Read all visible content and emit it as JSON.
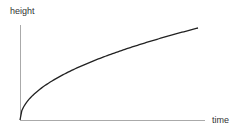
{
  "chart_data": {
    "type": "line",
    "title": "",
    "xlabel": "time",
    "ylabel": "height",
    "series": [
      {
        "name": "height vs time",
        "shape": "square-root growth",
        "x": [
          0,
          0.1,
          0.25,
          0.5,
          0.75,
          1.0
        ],
        "y": [
          0,
          0.32,
          0.5,
          0.71,
          0.87,
          1.0
        ]
      }
    ],
    "grid": false,
    "ticks": false
  },
  "labels": {
    "x": "time",
    "y": "height"
  }
}
